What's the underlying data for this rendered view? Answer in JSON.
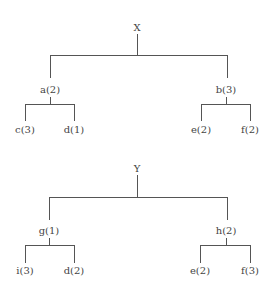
{
  "diagram": {
    "type": "tree",
    "trees": [
      {
        "root": "X",
        "children": [
          {
            "label": "a(2)",
            "children": [
              {
                "label": "c(3)"
              },
              {
                "label": "d(1)"
              }
            ]
          },
          {
            "label": "b(3)",
            "children": [
              {
                "label": "e(2)"
              },
              {
                "label": "f(2)"
              }
            ]
          }
        ]
      },
      {
        "root": "Y",
        "children": [
          {
            "label": "g(1)",
            "children": [
              {
                "label": "i(3)"
              },
              {
                "label": "d(2)"
              }
            ]
          },
          {
            "label": "h(2)",
            "children": [
              {
                "label": "e(2)"
              },
              {
                "label": "f(3)"
              }
            ]
          }
        ]
      }
    ]
  },
  "colors": {
    "line": "#555555",
    "text": "#444444",
    "background": "#ffffff"
  }
}
